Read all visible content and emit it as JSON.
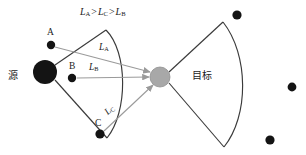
{
  "figure": {
    "type": "diagram",
    "colors": {
      "ink": "#1c1c1c",
      "wavefront": "#3a3a3a",
      "ray": "#9a9a9a",
      "point": "#141414",
      "target_fill": "#a8a8a8",
      "target_stroke": "#8a8a8a",
      "background": "#ffffff"
    }
  },
  "labels": {
    "inequality": {
      "l_a": "L",
      "l_a_sub": "A",
      "gt1": ">",
      "l_c": "L",
      "l_c_sub": "C",
      "gt2": ">",
      "l_b": "L",
      "l_b_sub": "B"
    },
    "source": "源",
    "target": "目标",
    "point_a": "A",
    "point_b": "B",
    "point_c": "C",
    "path_a": "L",
    "path_a_sub": "A",
    "path_b": "L",
    "path_b_sub": "B",
    "path_c": "L",
    "path_c_sub": "C"
  },
  "geometry": {
    "source_node": {
      "cx": 45,
      "cy": 72,
      "r": 12
    },
    "target_node": {
      "cx": 160,
      "cy": 77,
      "r": 10
    },
    "scatterers": [
      {
        "id": "A",
        "cx": 51,
        "cy": 45,
        "r": 4.2
      },
      {
        "id": "B",
        "cx": 72,
        "cy": 78,
        "r": 4.2
      },
      {
        "id": "C",
        "cx": 100,
        "cy": 134,
        "r": 4.6
      }
    ],
    "stray_dots": [
      {
        "cx": 237,
        "cy": 15,
        "r": 4.6
      },
      {
        "cx": 292,
        "cy": 87,
        "r": 4.4
      },
      {
        "cx": 270,
        "cy": 140,
        "r": 4.6
      }
    ],
    "left_wavefront": {
      "apex_top": [
        106,
        30
      ],
      "apex_bottom": [
        107,
        138
      ],
      "bulge_x": 131
    },
    "right_wavefront": {
      "apex_top": [
        223,
        22
      ],
      "apex_bottom": [
        224,
        147
      ],
      "bulge_x": 248
    }
  }
}
